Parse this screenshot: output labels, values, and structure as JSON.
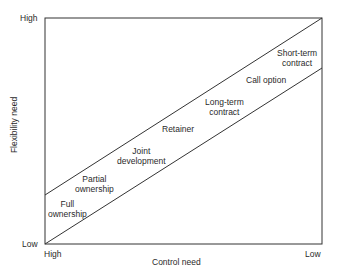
{
  "axes": {
    "x_label": "Control need",
    "y_label": "Flexibility need",
    "x_start": "High",
    "x_end": "Low",
    "y_top": "High",
    "y_bottom": "Low"
  },
  "regions": [
    {
      "line1": "Full",
      "line2": "ownership"
    },
    {
      "line1": "Partial",
      "line2": "ownership"
    },
    {
      "line1": "Joint",
      "line2": "development"
    },
    {
      "line1": "Retainer",
      "line2": ""
    },
    {
      "line1": "Long-term",
      "line2": "contract"
    },
    {
      "line1": "Call option",
      "line2": ""
    },
    {
      "line1": "Short-term",
      "line2": "contract"
    }
  ],
  "colors": {
    "line": "#333333",
    "text": "#2a2a2a",
    "background": "#ffffff"
  }
}
